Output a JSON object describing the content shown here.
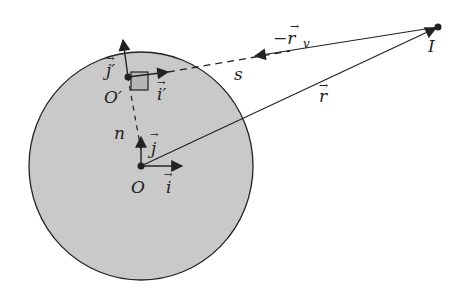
{
  "diagram": {
    "colors": {
      "disk_fill": "#c9c9c9",
      "stroke": "#222222",
      "small_square_fill": "#b5b5b5"
    },
    "labels": {
      "O": "O",
      "O_prime": "O′",
      "i": "i",
      "j": "j",
      "i_prime": "i′",
      "j_prime": "j′",
      "n": "n",
      "s": "s",
      "r": "r",
      "minus_rv": "−r",
      "rv_sub": "v",
      "I": "I",
      "vec_arrow": "→"
    }
  }
}
